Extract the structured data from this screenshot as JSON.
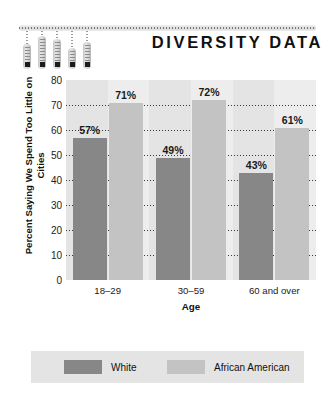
{
  "header": {
    "title": "DIVERSITY DATA",
    "decoration_icon": "hanging-thermometers-icon"
  },
  "chart_data": {
    "type": "bar",
    "title": "DIVERSITY DATA",
    "xlabel": "Age",
    "ylabel": "Percent Saying We Spend Too Little on Cities",
    "categories": [
      "18–29",
      "30–59",
      "60 and over"
    ],
    "series": [
      {
        "name": "White",
        "color": "#878787",
        "values": [
          57,
          49,
          43
        ],
        "labels": [
          "57%",
          "49%",
          "43%"
        ]
      },
      {
        "name": "African American",
        "color": "#c3c3c3",
        "values": [
          71,
          72,
          61
        ],
        "labels": [
          "71%",
          "72%",
          "61%"
        ]
      }
    ],
    "ylim": [
      0,
      80
    ],
    "yticks": [
      80,
      70,
      60,
      50,
      40,
      30,
      20,
      10,
      0
    ],
    "ytick_labels": [
      "80",
      "70",
      "60",
      "50",
      "40",
      "30",
      "20",
      "10",
      "0"
    ],
    "grid": true,
    "grid_style": "dotted-horizontal",
    "legend_position": "bottom",
    "plot_background": "#e4e4e4"
  },
  "legend": {
    "items": [
      {
        "label": "White",
        "swatch": "#878787"
      },
      {
        "label": "African American",
        "swatch": "#c3c3c3"
      }
    ]
  }
}
